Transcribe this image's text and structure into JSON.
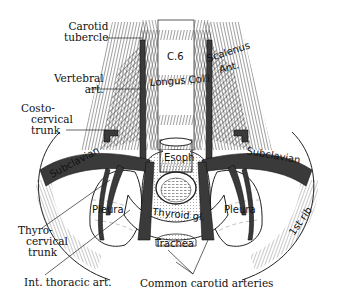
{
  "figure": {
    "colors": {
      "artery": "#3a3a3a",
      "muscle_hatch": "#555555",
      "background": "#ffffff",
      "ink": "#111111"
    }
  },
  "external_labels": {
    "carotid_tubercle": [
      "Carotid",
      "tubercle"
    ],
    "vertebral_art": [
      "Vertebral",
      "art."
    ],
    "costocervical_trunk": [
      "Costo-",
      "cervical",
      "trunk"
    ],
    "thyrocervical_trunk": [
      "Thyro-",
      "cervical",
      "trunk"
    ],
    "int_thoracic_art": "Int. thoracic art.",
    "common_carotid_arteries": "Common carotid arteries"
  },
  "internal_labels": {
    "c6": "C.6",
    "longus_colli": "Longus Colli",
    "scalenus_ant": [
      "Scalenus",
      "Ant."
    ],
    "esoph": "Esoph",
    "subclavian_left": "Subclavian",
    "subclavian_right": "Subclavian",
    "pleura_left": "Pleura",
    "pleura_right": "Pleura",
    "thyroid_gl": "Thyroid gl.",
    "trachea": "Trachea",
    "first_rib": "1st rib"
  }
}
